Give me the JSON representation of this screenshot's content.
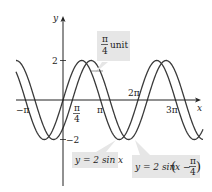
{
  "chart_data": {
    "type": "line",
    "title": "",
    "xlabel": "x",
    "ylabel": "y",
    "xlim": [
      -3.95,
      10.5
    ],
    "ylim": [
      -2.6,
      3.2
    ],
    "grid": false,
    "x_ticks": [
      {
        "value": -3.14159,
        "label": "−π"
      },
      {
        "value": 0.7854,
        "label": "π/4"
      },
      {
        "value": 3.14159,
        "label": "π"
      },
      {
        "value": 6.28319,
        "label": "2π"
      },
      {
        "value": 9.42478,
        "label": "3π"
      }
    ],
    "y_ticks": [
      {
        "value": 2,
        "label": "2"
      },
      {
        "value": -2,
        "label": "−2"
      }
    ],
    "series": [
      {
        "name": "y = 2 sin x",
        "function": "2*sin(x)",
        "phase_shift": 0,
        "amplitude": 2
      },
      {
        "name": "y = 2 sin(x − π/4)",
        "function": "2*sin(x - pi/4)",
        "phase_shift": 0.7854,
        "amplitude": 2
      }
    ],
    "annotations": [
      {
        "text": "π/4 unit",
        "points_to": "horizontal gap between the two curve peaks near x = π/2"
      },
      {
        "text": "y = 2 sin x",
        "points_to": "minimum of first curve near x = 3π/2"
      },
      {
        "text": "y = 2 sin(x − π/4)",
        "points_to": "minimum of second curve near x = 7π/4"
      }
    ]
  },
  "labels": {
    "y_axis": "y",
    "x_axis": "x",
    "tick_2": "2",
    "tick_neg2": "−2",
    "tick_neg_pi": "−π",
    "tick_pi": "π",
    "tick_2pi": "2π",
    "tick_3pi": "3π",
    "tick_pi4_num": "π",
    "tick_pi4_den": "4",
    "callout_unit_num": "π",
    "callout_unit_den": "4",
    "callout_unit_word": "unit",
    "callout_sin": "y = 2 sin x",
    "callout_shift_prefix": "y = 2 sin",
    "callout_shift_inner": "x −",
    "callout_shift_num": "π",
    "callout_shift_den": "4"
  }
}
